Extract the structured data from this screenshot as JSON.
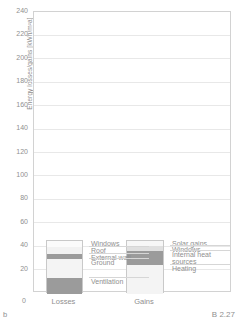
{
  "figure": {
    "sub_label": "b",
    "figure_number": "B 2.27"
  },
  "chart_data": {
    "type": "bar",
    "title": "",
    "xlabel": "",
    "ylabel": "Energy losses/gains [kWh/m²a]",
    "ylim": [
      0,
      240
    ],
    "yticks": [
      0,
      20,
      40,
      60,
      80,
      100,
      120,
      140,
      160,
      180,
      200,
      220,
      240
    ],
    "ytick_labels": [
      "0",
      "20",
      "40",
      "60",
      "80",
      "100",
      "120",
      "140",
      "160",
      "180",
      "200",
      "220",
      "240"
    ],
    "grid": true,
    "legend_position": "inline-right-of-each-bar",
    "categories": [
      "Losses",
      "Gains"
    ],
    "stacked": true,
    "series": [
      {
        "category": "Losses",
        "total": 45,
        "segments": [
          {
            "name": "Windows",
            "value": 5,
            "color": "#fbfbfb"
          },
          {
            "name": "Roof",
            "value": 6,
            "color": "#f2f2f2"
          },
          {
            "name": "External wall",
            "value": 4,
            "color": "#9b9b9b"
          },
          {
            "name": "Ground",
            "value": 16,
            "color": "#f4f4f4"
          },
          {
            "name": "Ventilation",
            "value": 14,
            "color": "#9b9b9b"
          }
        ]
      },
      {
        "category": "Gains",
        "total": 45,
        "segments": [
          {
            "name": "Solar gains",
            "value": 4,
            "color": "#f7f7f7"
          },
          {
            "name": "Windows",
            "value": 4,
            "color": "#e0e0e0"
          },
          {
            "name": "Internal heat sources",
            "value": 12,
            "color": "#9b9b9b"
          },
          {
            "name": "Heating",
            "value": 25,
            "color": "#f4f4f4"
          }
        ]
      }
    ]
  },
  "legend_losses": [
    {
      "label": "Windows"
    },
    {
      "label": "Roof"
    },
    {
      "label": "External wall"
    },
    {
      "label": "Ground"
    },
    {
      "label": "Ventilation"
    }
  ],
  "legend_gains": [
    {
      "label": "Solar gains"
    },
    {
      "label": "Windows"
    },
    {
      "label": "Internal heat sources"
    },
    {
      "label": "Heating"
    }
  ],
  "axis": {
    "zero_label": "0"
  },
  "colors": {
    "frame": "#d2d2d2",
    "grid": "#e8e8e8",
    "text": "#8f8f8f",
    "dark_segment": "#9b9b9b",
    "light_segment": "#f4f4f4"
  }
}
